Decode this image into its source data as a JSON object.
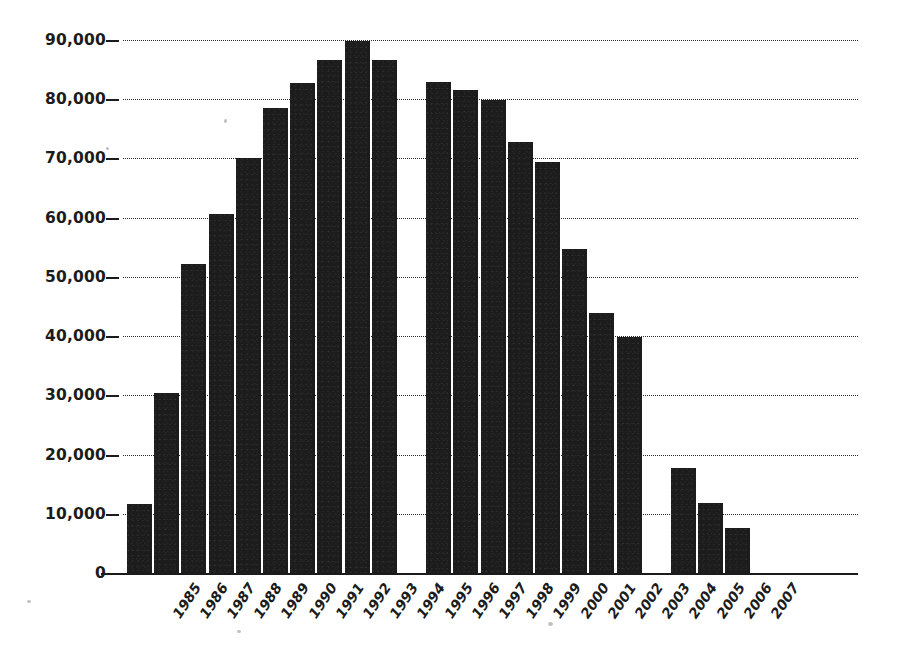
{
  "chart_data": {
    "type": "bar",
    "title": "",
    "subtitle": "",
    "xlabel": "",
    "ylabel": "",
    "categories": [
      "1985",
      "1986",
      "1987",
      "1988",
      "1989",
      "1990",
      "1991",
      "1992",
      "1993",
      "1994",
      "1995",
      "1996",
      "1997",
      "1998",
      "1999",
      "2000",
      "2001",
      "2002",
      "2003",
      "2004",
      "2005",
      "2006",
      "2007"
    ],
    "values": [
      11700,
      30400,
      52200,
      60600,
      70100,
      78500,
      82800,
      86700,
      89900,
      86700,
      null,
      82900,
      81600,
      79900,
      72800,
      69400,
      54700,
      43900,
      39900,
      null,
      17700,
      11800,
      7600
    ],
    "ylim": [
      0,
      90000
    ],
    "ytick_values": [
      0,
      10000,
      20000,
      30000,
      40000,
      50000,
      60000,
      70000,
      80000,
      90000
    ],
    "ytick_labels": [
      "0",
      "10,000",
      "20,000",
      "30,000",
      "40,000",
      "50,000",
      "60,000",
      "70,000",
      "80,000",
      "90,000"
    ],
    "grid": true,
    "grid_style": "dotted-horizontal",
    "legend": null,
    "legend_position": "none",
    "missing_categories": [
      "1995",
      "2004"
    ],
    "bar_color": "#1c1c1c",
    "axis_color": "#1b1b1b",
    "background_color": "#ffffff"
  },
  "meta": {
    "y_axis_name": "y-axis",
    "x_axis_name": "x-axis"
  }
}
